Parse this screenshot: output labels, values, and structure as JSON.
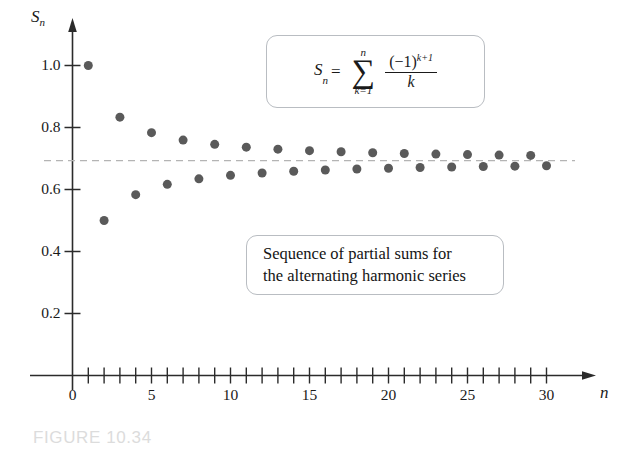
{
  "figure": {
    "number_label": "FIGURE 10.34"
  },
  "axes": {
    "y_name": "S",
    "y_name_sub": "n",
    "x_name": "n"
  },
  "formula": {
    "lhs_var": "S",
    "lhs_sub": "n",
    "equals": "=",
    "sigma": "∑",
    "sigma_top": "n",
    "sigma_bottom": "k=1",
    "numerator": "(−1)",
    "numerator_exp": "k+1",
    "denominator": "k",
    "plain_text": "S_n = sum_{k=1}^{n} (-1)^{k+1} / k"
  },
  "caption_box": {
    "line1": "Sequence of partial sums for",
    "line2": "the alternating harmonic series"
  },
  "chart_data": {
    "type": "scatter",
    "title": "Sequence of partial sums for the alternating harmonic series",
    "xlabel": "n",
    "ylabel": "S_n",
    "xlim": [
      0,
      31.5
    ],
    "ylim": [
      0,
      1.08
    ],
    "grid": false,
    "legend": null,
    "x_tick_labels": [
      "0",
      "5",
      "10",
      "15",
      "20",
      "25",
      "30"
    ],
    "x_tick_values": [
      0,
      5,
      10,
      15,
      20,
      25,
      30
    ],
    "x_minor_tick_values": [
      1,
      2,
      3,
      4,
      5,
      6,
      7,
      8,
      9,
      10,
      11,
      12,
      13,
      14,
      15,
      16,
      17,
      18,
      19,
      20,
      21,
      22,
      23,
      24,
      25,
      26,
      27,
      28,
      29,
      30
    ],
    "y_tick_labels": [
      "0.2",
      "0.4",
      "0.6",
      "0.8",
      "1.0"
    ],
    "y_tick_values": [
      0.2,
      0.4,
      0.6,
      0.8,
      1.0
    ],
    "marker": "filled-circle",
    "marker_color": "#5a5a5a",
    "marker_size_px": 9,
    "reference_line": {
      "value": 0.6931,
      "label": "ln 2",
      "style": "dashed",
      "color": "#b4b4b4"
    },
    "x": [
      1,
      2,
      3,
      4,
      5,
      6,
      7,
      8,
      9,
      10,
      11,
      12,
      13,
      14,
      15,
      16,
      17,
      18,
      19,
      20,
      21,
      22,
      23,
      24,
      25,
      26,
      27,
      28,
      29,
      30
    ],
    "values": [
      1.0,
      0.5,
      0.8333,
      0.5833,
      0.7833,
      0.6167,
      0.7595,
      0.6345,
      0.7456,
      0.6456,
      0.7365,
      0.6532,
      0.7301,
      0.6587,
      0.7254,
      0.6629,
      0.7217,
      0.6661,
      0.7187,
      0.6687,
      0.7163,
      0.6708,
      0.7143,
      0.6726,
      0.7126,
      0.6741,
      0.7111,
      0.6754,
      0.7099,
      0.6765
    ]
  }
}
